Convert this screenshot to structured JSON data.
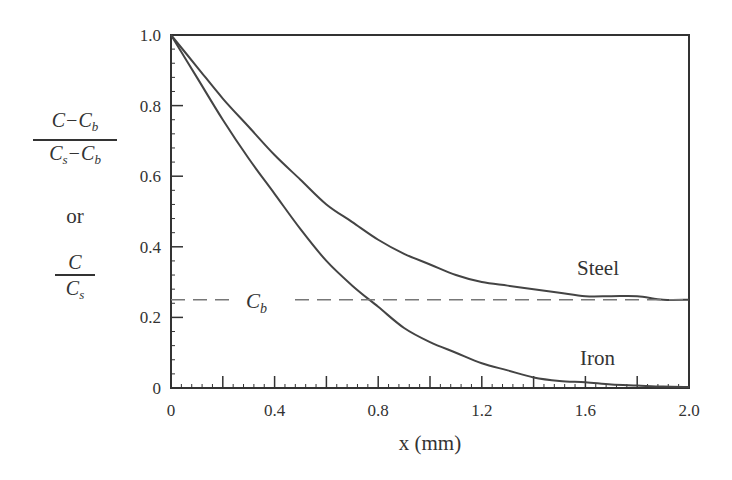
{
  "chart_data": {
    "type": "line",
    "title": "",
    "xlabel": "x (mm)",
    "ylabel": "(C−Cb)/(Cs−Cb) or C/Cs",
    "xlim": [
      0,
      2.0
    ],
    "ylim": [
      0,
      1.0
    ],
    "x_ticks": [
      "0",
      "0.4",
      "0.8",
      "1.2",
      "1.6",
      "2.0"
    ],
    "y_ticks": [
      "0",
      "0.2",
      "0.4",
      "0.6",
      "0.8",
      "1.0"
    ],
    "grid": false,
    "legend": "inline labels",
    "x": [
      0,
      0.1,
      0.2,
      0.3,
      0.4,
      0.5,
      0.6,
      0.7,
      0.8,
      0.9,
      1.0,
      1.1,
      1.2,
      1.3,
      1.4,
      1.5,
      1.6,
      1.7,
      1.8,
      1.9,
      2.0
    ],
    "series": [
      {
        "name": "Steel",
        "values": [
          1.0,
          0.91,
          0.82,
          0.74,
          0.66,
          0.59,
          0.52,
          0.47,
          0.42,
          0.38,
          0.35,
          0.32,
          0.3,
          0.29,
          0.28,
          0.27,
          0.26,
          0.26,
          0.26,
          0.25,
          0.25
        ]
      },
      {
        "name": "Iron",
        "values": [
          1.0,
          0.88,
          0.76,
          0.65,
          0.55,
          0.45,
          0.36,
          0.29,
          0.23,
          0.17,
          0.13,
          0.1,
          0.07,
          0.05,
          0.03,
          0.02,
          0.016,
          0.01,
          0.007,
          0.004,
          0.003
        ]
      }
    ],
    "annotations": [
      {
        "text": "Cb",
        "type": "dashed horizontal reference line",
        "y": 0.25
      }
    ]
  },
  "labels": {
    "steel": "Steel",
    "iron": "Iron",
    "cb_main": "C",
    "cb_sub": "b",
    "xlabel": "x (mm)",
    "ylabel_frac1_num": "C−C",
    "ylabel_frac1_num_sub": "b",
    "ylabel_frac1_den_a": "C",
    "ylabel_frac1_den_a_sub": "s",
    "ylabel_frac1_den_b": "−C",
    "ylabel_frac1_den_b_sub": "b",
    "ylabel_or": "or",
    "ylabel_frac2_num": "C",
    "ylabel_frac2_den": "C",
    "ylabel_frac2_den_sub": "s"
  },
  "colors": {
    "axis": "#333333",
    "curve": "#444444",
    "dashed": "#777777"
  }
}
